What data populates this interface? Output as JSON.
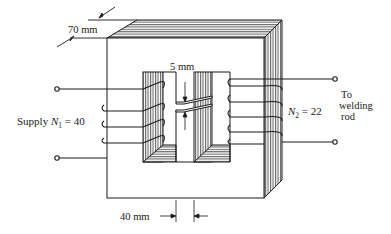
{
  "diagram": {
    "dimensions": {
      "depth": "70 mm",
      "gap": "5 mm",
      "limb_width": "40 mm"
    },
    "primary": {
      "label_prefix": "Supply ",
      "symbol": "N",
      "subscript": "1",
      "equals": " = ",
      "turns": "40"
    },
    "secondary": {
      "symbol": "N",
      "subscript": "2",
      "equals": " = ",
      "turns": "22",
      "destination_line1": "To",
      "destination_line2": "welding",
      "destination_line3": "rod"
    },
    "colors": {
      "line": "#1a1a1a",
      "hatch": "#555555",
      "background": "#ffffff"
    }
  }
}
